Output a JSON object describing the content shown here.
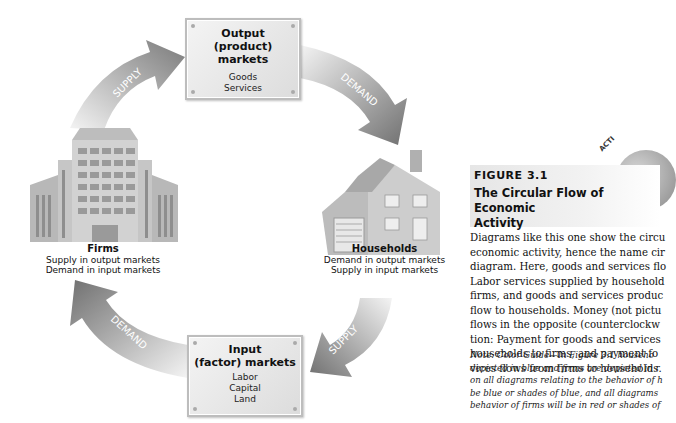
{
  "diagram": {
    "output_market": {
      "title_line1": "Output",
      "title_line2": "(product) markets",
      "items": [
        "Goods",
        "Services"
      ]
    },
    "input_market": {
      "title_line1": "Input",
      "title_line2": "(factor) markets",
      "items": [
        "Labor",
        "Capital",
        "Land"
      ]
    },
    "firms": {
      "name": "Firms",
      "desc": [
        "Supply in output markets",
        "Demand in input markets"
      ]
    },
    "households": {
      "name": "Households",
      "desc": [
        "Demand in output markets",
        "Supply in input markets"
      ]
    },
    "arrows": {
      "top_left": "SUPPLY",
      "top_right": "DEMAND",
      "bottom_right": "SUPPLY",
      "bottom_left": "DEMAND"
    }
  },
  "caption": {
    "badge": "ACTI",
    "figure_number": "FIGURE 3.1",
    "title_line1": "The Circular Flow of Economic",
    "title_line2": "Activity",
    "body_lines": [
      "Diagrams like this one show the circu",
      "economic activity, hence the name cir",
      "diagram. Here, goods and services flo",
      "Labor services supplied by household",
      "firms, and goods and services produc",
      "flow to households. Money (not pictu",
      "flows in the opposite (counterclockw",
      "tion: Payment for goods and services",
      "households to firms, and payment fo",
      "vices flows from firms to households."
    ],
    "note_lines": [
      "Note: Color Guide—In Figure 3.1 househo",
      "depicted in blue and firms are depicted in r",
      "on all diagrams relating to the behavior of h",
      "be blue or shades of blue, and all diagrams",
      "behavior of firms will be in red or shades of"
    ]
  },
  "colors": {
    "arrow_dark": "#7a7a7a",
    "arrow_light": "#f0f0f0",
    "box_border": "#bdbdbd",
    "caption_bg": "#e6e6e6",
    "text": "#111111"
  }
}
